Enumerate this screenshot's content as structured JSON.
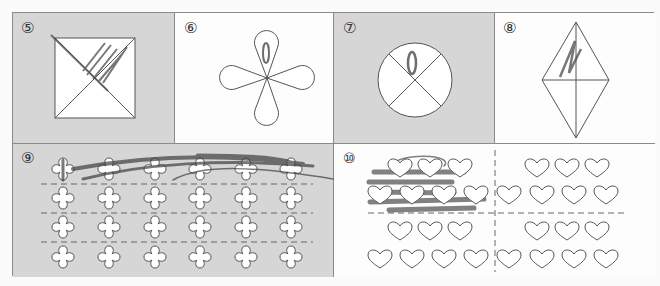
{
  "worksheet": {
    "problems": [
      {
        "id": "5",
        "label": "⑤",
        "shape": "square divided by two diagonals into 4 triangles",
        "shaded_background": true,
        "colored_parts": 1,
        "total_parts": 4
      },
      {
        "id": "6",
        "label": "⑥",
        "shape": "four-petal flower",
        "shaded_background": false,
        "colored_parts": 1,
        "total_parts": 4
      },
      {
        "id": "7",
        "label": "⑦",
        "shape": "circle divided into 4 parts by X",
        "shaded_background": true,
        "colored_parts": 1,
        "total_parts": 4
      },
      {
        "id": "8",
        "label": "⑧",
        "shape": "rhombus divided into 4 triangles",
        "shaded_background": false,
        "colored_parts": 1,
        "total_parts": 4
      },
      {
        "id": "9",
        "label": "⑨",
        "shape": "24 clover shapes in 4 rows of 6, separated by dashed lines",
        "shaded_background": true,
        "rows": 4,
        "cols": 6,
        "colored_rows": 1
      },
      {
        "id": "10",
        "label": "⑩",
        "shape": "28 hearts in 4 groups of 7, separated by dashed cross",
        "shaded_background": false,
        "groups": 4,
        "per_group": 7,
        "colored_groups": 1
      }
    ]
  },
  "colors": {
    "cell_gray": "#d6d6d6",
    "cell_white": "#fdfdfd",
    "line": "#555555",
    "pencil": "#4a4a4a"
  }
}
